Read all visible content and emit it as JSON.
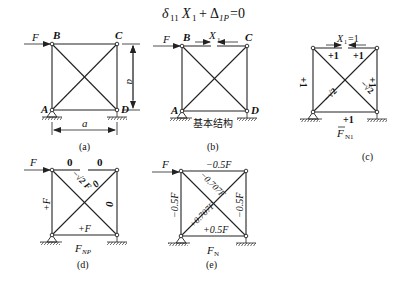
{
  "formula": {
    "delta": "δ",
    "delta_sub": "11",
    "x": "X",
    "x_sub": "1",
    "plus": "+",
    "Delta": "Δ",
    "Delta_sub": "1P",
    "equals": "=0"
  },
  "panels": {
    "a": {
      "caption": "(a)",
      "force": "F",
      "nodes": {
        "A": "A",
        "B": "B",
        "C": "C",
        "D": "D"
      },
      "dim_vertical": "a",
      "dim_horizontal": "a"
    },
    "b": {
      "caption": "(b)",
      "force": "F",
      "nodes": {
        "A": "A",
        "B": "B",
        "C": "C",
        "D": "D"
      },
      "redundant": "X",
      "redundant_sub": "1",
      "label": "基本结构"
    },
    "c": {
      "caption": "(c)",
      "redundant": "X",
      "redundant_sub": "1",
      "redundant_value": "=1",
      "forces": {
        "top_left": "+1",
        "top_right": "+1",
        "left": "+1",
        "right": "+1",
        "bottom": "+1",
        "diag_AC": "−√2",
        "diag_BD": "−√2"
      },
      "title": "F",
      "title_sub": "N1"
    },
    "d": {
      "caption": "(d)",
      "force": "F",
      "forces": {
        "top_left": "0",
        "top_right": "0",
        "left": "+F",
        "right": "0",
        "bottom": "+F",
        "diag_BD": "−√2 F",
        "diag_AC": "0"
      },
      "title": "F",
      "title_sub": "NP"
    },
    "e": {
      "caption": "(e)",
      "force": "F",
      "forces": {
        "top": "−0.5F",
        "left": "−0.5F",
        "right": "−0.5F",
        "bottom": "+0.5F",
        "diag_BD": "−0.707F",
        "diag_AC": "+0.707F"
      },
      "title": "F",
      "title_sub": "N"
    }
  }
}
